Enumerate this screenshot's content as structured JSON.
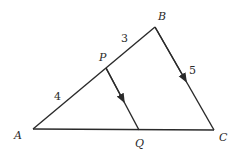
{
  "diagram": {
    "points": {
      "A": {
        "label": "A",
        "x": 33,
        "y": 129
      },
      "B": {
        "label": "B",
        "x": 155,
        "y": 27
      },
      "C": {
        "label": "C",
        "x": 214,
        "y": 130
      },
      "P": {
        "label": "P",
        "x": 106,
        "y": 68
      },
      "Q": {
        "label": "Q",
        "x": 139,
        "y": 130
      }
    },
    "segments": [
      {
        "from": "A",
        "to": "B"
      },
      {
        "from": "B",
        "to": "C",
        "arrow": true
      },
      {
        "from": "A",
        "to": "C"
      },
      {
        "from": "P",
        "to": "Q",
        "arrow": true
      }
    ],
    "lengths": {
      "AP": "4",
      "PB": "3",
      "BC": "5"
    }
  }
}
